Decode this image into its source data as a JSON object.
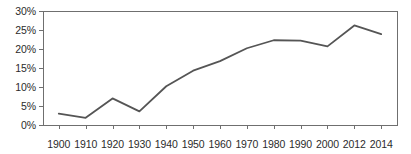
{
  "chart_data": {
    "type": "line",
    "title": "",
    "subtitle": "",
    "xlabel": "",
    "ylabel": "",
    "categories": [
      "1900",
      "1910",
      "1920",
      "1930",
      "1940",
      "1950",
      "1960",
      "1970",
      "1980",
      "1990",
      "2000",
      "2012",
      "2014"
    ],
    "values": [
      3.0,
      1.9,
      7.0,
      3.6,
      10.2,
      14.3,
      16.8,
      20.2,
      22.3,
      22.2,
      20.7,
      26.2,
      23.9
    ],
    "series": [
      {
        "name": "",
        "values": [
          3.0,
          1.9,
          7.0,
          3.6,
          10.2,
          14.3,
          16.8,
          20.2,
          22.3,
          22.2,
          20.7,
          26.2,
          23.9
        ]
      }
    ],
    "ylim": [
      0,
      30
    ],
    "ytick_values": [
      0,
      5,
      10,
      15,
      20,
      25,
      30
    ],
    "ytick_labels": [
      "0%",
      "5%",
      "10%",
      "15%",
      "20%",
      "25%",
      "30%"
    ],
    "grid": false,
    "legend": "none",
    "line_color": "#555555",
    "axis_color": "#6f6f6f",
    "text_color": "#2b2b2b",
    "background_color": "#ffffff"
  },
  "plot": {
    "left": 43,
    "right": 397,
    "top": 11,
    "bottom": 125
  }
}
